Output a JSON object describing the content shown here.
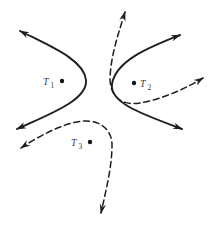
{
  "figure": {
    "kind": "phase-portrait-diagram",
    "background": "#ffffff",
    "colors": {
      "stroke": "#1e1e1e",
      "label": "#424242",
      "dot": "#161616"
    },
    "points": [
      {
        "name": "T1",
        "letter": "T",
        "subscript": "1",
        "dot_x": "62",
        "dot_y": "81",
        "dot_r": "2.2",
        "letter_x": "43",
        "letter_y": "85",
        "sub_x": "50.5",
        "sub_y": "88"
      },
      {
        "name": "T2",
        "letter": "T",
        "subscript": "2",
        "dot_x": "134",
        "dot_y": "83",
        "dot_r": "2.2",
        "letter_x": "140",
        "letter_y": "87",
        "sub_x": "147.5",
        "sub_y": "90"
      },
      {
        "name": "T3",
        "letter": "T",
        "subscript": "3",
        "dot_x": "90",
        "dot_y": "142",
        "dot_r": "2.2",
        "letter_x": "71",
        "letter_y": "146",
        "sub_x": "78.5",
        "sub_y": "149"
      }
    ],
    "curves": [
      {
        "name": "solid-trajectory-left",
        "style": "solid",
        "path": "M 20 31 C 52 47, 84 60, 86 80 C 88 100, 50 114, 17 129"
      },
      {
        "name": "solid-trajectory-right",
        "style": "solid",
        "path": "M 180 35 C 150 47, 116 60, 112 84 C 109 104, 148 116, 182 129"
      },
      {
        "name": "dashed-trajectory-top-right",
        "style": "dashed",
        "path": "M 125 12 C 118 35, 111 55, 110 78 C 110 97, 122 106, 140 103 C 162 99, 185 89, 203 78"
      },
      {
        "name": "dashed-trajectory-bottom-left",
        "style": "dashed",
        "path": "M 21 148 C 42 134, 68 121, 86 121 C 102 121, 112 131, 112 145 C 112 167, 106 190, 101 213"
      }
    ]
  }
}
